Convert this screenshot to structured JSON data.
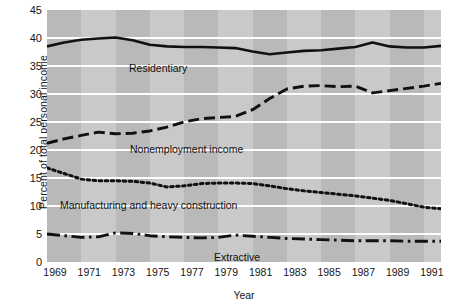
{
  "chart_data": {
    "type": "line",
    "title": "",
    "xlabel": "Year",
    "ylabel": "Percent of total personal income",
    "xlim": [
      1969,
      1992
    ],
    "ylim": [
      0,
      45
    ],
    "yticks": [
      0,
      5,
      10,
      15,
      20,
      25,
      30,
      35,
      40,
      45
    ],
    "xticks": [
      1969,
      1971,
      1973,
      1975,
      1977,
      1979,
      1981,
      1983,
      1985,
      1987,
      1989,
      1991
    ],
    "grid": "horizontal-white-gridlines",
    "legend": "inline-annotations",
    "plot_background": "#b9b9b9",
    "band_color": "#c9c9c9",
    "line_color": "#111111",
    "x": [
      1969,
      1970,
      1971,
      1972,
      1973,
      1974,
      1975,
      1976,
      1977,
      1978,
      1979,
      1980,
      1981,
      1982,
      1983,
      1984,
      1985,
      1986,
      1987,
      1988,
      1989,
      1990,
      1991,
      1992
    ],
    "series": [
      {
        "name": "Residentiary",
        "style": "solid",
        "values": [
          38.5,
          39.2,
          39.7,
          39.9,
          40.1,
          39.6,
          38.8,
          38.5,
          38.4,
          38.4,
          38.3,
          38.2,
          37.6,
          37.1,
          37.4,
          37.7,
          37.8,
          38.1,
          38.4,
          39.2,
          38.5,
          38.3,
          38.3,
          38.6
        ]
      },
      {
        "name": "Nonemployment income",
        "style": "dashed",
        "values": [
          21.2,
          22.0,
          22.6,
          23.2,
          22.9,
          23.0,
          23.4,
          24.1,
          25.0,
          25.6,
          25.8,
          26.0,
          27.2,
          29.2,
          30.9,
          31.4,
          31.5,
          31.3,
          31.4,
          30.2,
          30.6,
          31.0,
          31.4,
          31.9
        ]
      },
      {
        "name": "Manufacturing and heavy construction",
        "style": "dotted",
        "values": [
          16.8,
          15.8,
          14.8,
          14.5,
          14.5,
          14.4,
          14.1,
          13.4,
          13.6,
          14.0,
          14.1,
          14.1,
          14.0,
          13.6,
          13.1,
          12.7,
          12.4,
          12.1,
          11.8,
          11.4,
          11.0,
          10.4,
          9.8,
          9.5
        ]
      },
      {
        "name": "Extractive",
        "style": "dash-dot",
        "values": [
          5.0,
          4.7,
          4.4,
          4.5,
          5.2,
          5.1,
          4.7,
          4.5,
          4.4,
          4.3,
          4.4,
          4.8,
          4.6,
          4.4,
          4.2,
          4.1,
          4.0,
          3.9,
          3.8,
          3.8,
          3.8,
          3.7,
          3.7,
          3.7
        ]
      }
    ],
    "annotations": [
      {
        "text": "Residentiary",
        "x_px": 129,
        "y_px": 62
      },
      {
        "text": "Nonemployment income",
        "x_px": 130,
        "y_px": 143
      },
      {
        "text": "Manufacturing and heavy construction",
        "x_px": 60,
        "y_px": 199
      },
      {
        "text": "Extractive",
        "x_px": 214,
        "y_px": 251
      }
    ]
  }
}
